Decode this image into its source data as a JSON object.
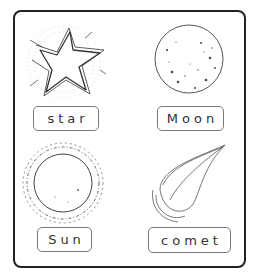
{
  "worksheet": {
    "cards": [
      {
        "label": "star",
        "icon": "star-icon"
      },
      {
        "label": "Moon",
        "icon": "moon-icon"
      },
      {
        "label": "Sun",
        "icon": "sun-icon"
      },
      {
        "label": "comet",
        "icon": "comet-icon"
      }
    ]
  }
}
